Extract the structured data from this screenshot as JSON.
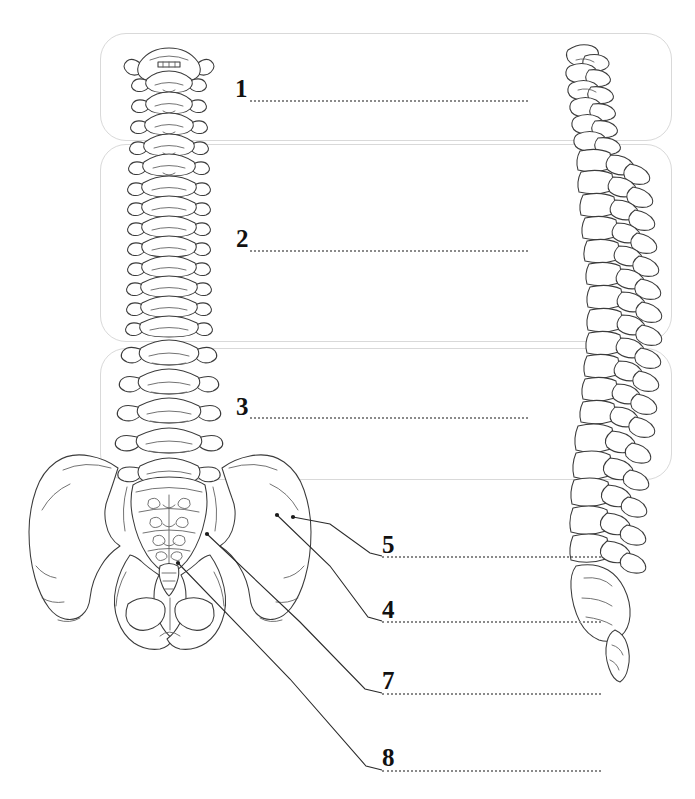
{
  "page": {
    "width": 695,
    "height": 799,
    "background_color": "#ffffff"
  },
  "style": {
    "box_border_color": "#d9d9d9",
    "dotted_line_color": "#8a8a8a",
    "number_color": "#111111",
    "bone_outline_color": "#3b3b3b",
    "leader_line_color": "#2b2b2b"
  },
  "answer_boxes": [
    {
      "id": "box-1",
      "x": 100,
      "y": 33,
      "width": 572,
      "height": 108
    },
    {
      "id": "box-2",
      "x": 100,
      "y": 144,
      "width": 572,
      "height": 198
    },
    {
      "id": "box-3",
      "x": 100,
      "y": 348,
      "width": 572,
      "height": 132
    }
  ],
  "labels": [
    {
      "number": "1",
      "num_x": 235,
      "num_y": 76,
      "line_x": 250,
      "line_y": 100,
      "line_width": 278,
      "target": "cervical-vertebrae",
      "has_leader": false
    },
    {
      "number": "2",
      "num_x": 236,
      "num_y": 226,
      "line_x": 250,
      "line_y": 250,
      "line_width": 278,
      "target": "thoracic-vertebrae",
      "has_leader": false
    },
    {
      "number": "3",
      "num_x": 236,
      "num_y": 394,
      "line_x": 250,
      "line_y": 417,
      "line_width": 278,
      "target": "lumbar-vertebrae",
      "has_leader": false
    },
    {
      "number": "5",
      "num_x": 382,
      "num_y": 532,
      "line_x": 382,
      "line_y": 556,
      "line_width": 219,
      "target": "iliac-crest",
      "has_leader": true,
      "leader_points": "293,517 330,524 370,553 382,556",
      "dot_x": 293,
      "dot_y": 517
    },
    {
      "number": "4",
      "num_x": 382,
      "num_y": 597,
      "line_x": 382,
      "line_y": 621,
      "line_width": 219,
      "target": "ilium",
      "has_leader": true,
      "leader_points": "277,515 330,566 368,617 382,621",
      "dot_x": 277,
      "dot_y": 515
    },
    {
      "number": "7",
      "num_x": 382,
      "num_y": 668,
      "line_x": 382,
      "line_y": 693,
      "line_width": 219,
      "target": "sacrum",
      "has_leader": true,
      "leader_points": "207,534 300,622 365,689 382,693",
      "dot_x": 207,
      "dot_y": 534
    },
    {
      "number": "8",
      "num_x": 382,
      "num_y": 745,
      "line_x": 382,
      "line_y": 770,
      "line_width": 219,
      "target": "coccyx",
      "has_leader": true,
      "leader_points": "178,563 290,679 366,766 382,770",
      "dot_x": 178,
      "dot_y": 563
    }
  ],
  "illustrations": [
    {
      "id": "anterior-spine-pelvis",
      "name": "anterior-view-spine-and-pelvis",
      "description": "Anterior view of vertebral column with pelvis"
    },
    {
      "id": "lateral-spine",
      "name": "lateral-view-spine",
      "description": "Lateral (side) view of vertebral column"
    }
  ]
}
